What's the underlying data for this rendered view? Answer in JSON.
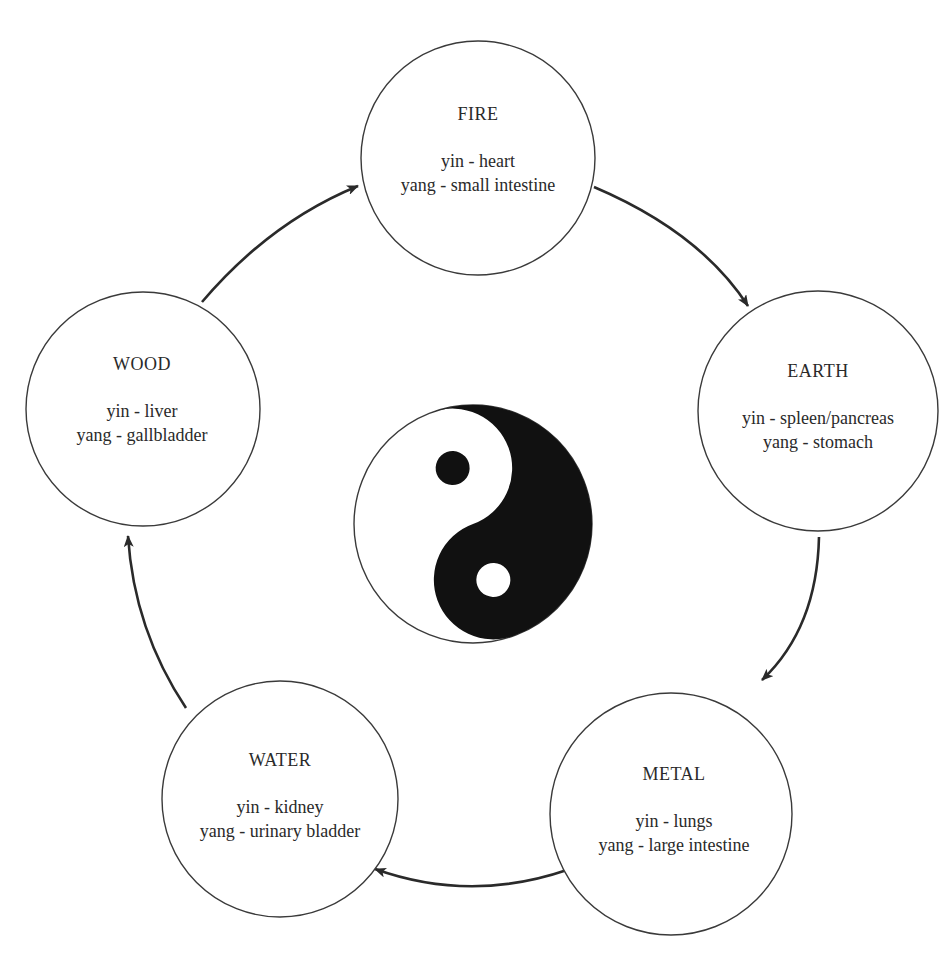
{
  "diagram": {
    "type": "five-element-cycle",
    "colors": {
      "stroke": "#2a2a2a",
      "fill": "#ffffff",
      "yin_yang_dark": "#111111",
      "text": "#2a2a2a"
    },
    "elements": [
      {
        "id": "fire",
        "title": "FIRE",
        "yin": "yin - heart",
        "yang": "yang - small intestine"
      },
      {
        "id": "earth",
        "title": "EARTH",
        "yin": "yin - spleen/pancreas",
        "yang": "yang - stomach"
      },
      {
        "id": "metal",
        "title": "METAL",
        "yin": "yin - lungs",
        "yang": "yang - large intestine"
      },
      {
        "id": "water",
        "title": "WATER",
        "yin": "yin - kidney",
        "yang": "yang - urinary bladder"
      },
      {
        "id": "wood",
        "title": "WOOD",
        "yin": "yin - liver",
        "yang": "yang - gallbladder"
      }
    ],
    "cycle": [
      {
        "from": "wood",
        "to": "fire"
      },
      {
        "from": "fire",
        "to": "earth"
      },
      {
        "from": "earth",
        "to": "metal"
      },
      {
        "from": "metal",
        "to": "water"
      },
      {
        "from": "water",
        "to": "wood"
      }
    ],
    "center_symbol": "yin-yang"
  }
}
